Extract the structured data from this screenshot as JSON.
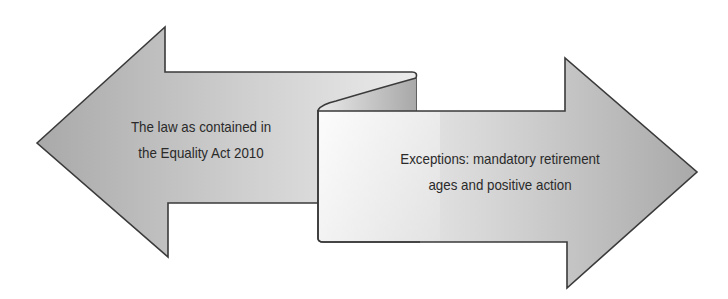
{
  "diagram": {
    "type": "double-arrow-with-fold",
    "left_arrow": {
      "direction": "left",
      "lines": [
        "The law as contained in",
        "the Equality Act 2010"
      ]
    },
    "right_arrow": {
      "direction": "right",
      "lines": [
        "Exceptions: mandatory retirement",
        "ages and positive action"
      ]
    },
    "colors": {
      "arrow_fill_dark": "#b0b0b0",
      "arrow_fill_light": "#f2f2f2",
      "stroke": "#3a3a3a",
      "text": "#2a2a2a",
      "background": "#ffffff"
    }
  }
}
